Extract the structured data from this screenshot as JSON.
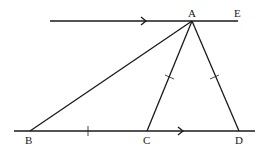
{
  "diagram": {
    "type": "geometry",
    "points": {
      "A": {
        "label": "A",
        "x": 192,
        "y": 21
      },
      "E": {
        "label": "E",
        "x": 238,
        "y": 21
      },
      "B": {
        "label": "B",
        "x": 30,
        "y": 131
      },
      "C": {
        "label": "C",
        "x": 147,
        "y": 131
      },
      "D": {
        "label": "D",
        "x": 239,
        "y": 131
      }
    },
    "lines": [
      {
        "name": "top-parallel-line",
        "from": [
          50,
          21
        ],
        "to": [
          238,
          21
        ],
        "arrow": true
      },
      {
        "name": "bottom-parallel-line",
        "from": [
          14,
          131
        ],
        "to": [
          255,
          131
        ],
        "arrow": true
      },
      {
        "name": "segment-AB",
        "from": "A",
        "to": "B"
      },
      {
        "name": "segment-AC",
        "from": "A",
        "to": "C",
        "tick": true
      },
      {
        "name": "segment-AD",
        "from": "A",
        "to": "D",
        "tick": true
      }
    ],
    "equal_marks": [
      "BC",
      "AC",
      "AD"
    ],
    "stroke_color": "#1a1a1a"
  }
}
